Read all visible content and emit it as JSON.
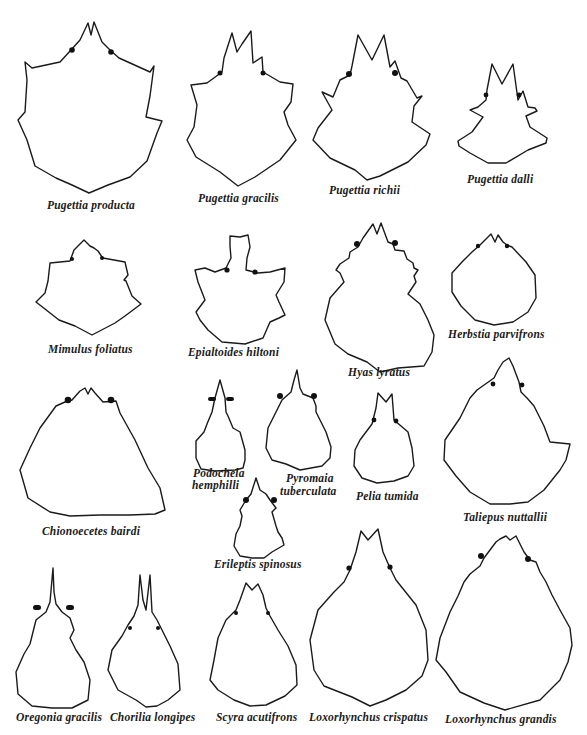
{
  "figure": {
    "type": "carapace outline plate",
    "ink_color": "#1a1a1a",
    "background": "#ffffff"
  },
  "specimens": [
    {
      "id": "pugettia-producta",
      "label": "Pugettia producta",
      "row": 1
    },
    {
      "id": "pugettia-gracilis",
      "label": "Pugettia gracilis",
      "row": 1
    },
    {
      "id": "pugettia-richii",
      "label": "Pugettia richii",
      "row": 1
    },
    {
      "id": "pugettia-dalli",
      "label": "Pugettia dalli",
      "row": 1
    },
    {
      "id": "mimulus-foliatus",
      "label": "Mimulus foliatus",
      "row": 2
    },
    {
      "id": "epialtoides-hiltoni",
      "label": "Epialtoides hiltoni",
      "row": 2
    },
    {
      "id": "hyas-lyratus",
      "label": "Hyas lyratus",
      "row": 2
    },
    {
      "id": "herbstia-parvifrons",
      "label": "Herbstia parvifrons",
      "row": 2
    },
    {
      "id": "chionoecetes-bairdi",
      "label": "Chionoecetes bairdi",
      "row": 3
    },
    {
      "id": "podochela-hemphilli",
      "label_line1": "Podochela",
      "label_line2": "hemphilli",
      "row": 3
    },
    {
      "id": "pyromaia-tuberculata",
      "label_line1": "Pyromaia",
      "label_line2": "tuberculata",
      "row": 3
    },
    {
      "id": "pelia-tumida",
      "label": "Pelia tumida",
      "row": 3
    },
    {
      "id": "taliepus-nuttallii",
      "label": "Taliepus nuttallii",
      "row": 3
    },
    {
      "id": "erileptis-spinosus",
      "label": "Erileptis spinosus",
      "row": 3
    },
    {
      "id": "oregonia-gracilis",
      "label": "Oregonia gracilis",
      "row": 4
    },
    {
      "id": "chorilia-longipes",
      "label": "Chorilia longipes",
      "row": 4
    },
    {
      "id": "scyra-acutifrons",
      "label": "Scyra acutifrons",
      "row": 4
    },
    {
      "id": "loxorhynchus-crispatus",
      "label": "Loxorhynchus crispatus",
      "row": 4
    },
    {
      "id": "loxorhynchus-grandis",
      "label": "Loxorhynchus grandis",
      "row": 4
    }
  ]
}
